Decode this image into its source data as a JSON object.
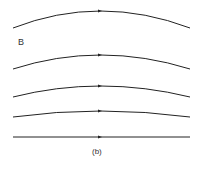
{
  "diagram": {
    "field_label": "B",
    "caption": "(b)",
    "line_color": "#222222",
    "lines": [
      {
        "id": "field-line-1",
        "y_end": 28,
        "y_peak": 11
      },
      {
        "id": "field-line-2",
        "y_end": 69,
        "y_peak": 55
      },
      {
        "id": "field-line-3",
        "y_end": 97,
        "y_peak": 86
      },
      {
        "id": "field-line-4",
        "y_end": 117,
        "y_peak": 111
      },
      {
        "id": "field-line-5",
        "y_end": 137,
        "y_peak": 137
      }
    ],
    "arrow_direction": "right"
  }
}
